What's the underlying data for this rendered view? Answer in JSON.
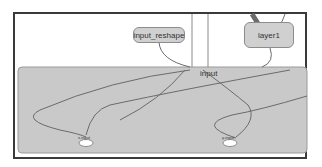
{
  "graph": {
    "nodes": {
      "input_reshape": {
        "label": "input_reshape"
      },
      "layer1": {
        "label": "layer1"
      }
    },
    "group": {
      "label": "input"
    },
    "ops": [
      {
        "label": "x-input"
      },
      {
        "label": "y-input"
      }
    ],
    "colors": {
      "frame_border": "#3a3a3a",
      "group_fill": "#c9c9c9",
      "node_fill": "#d0d0d0",
      "edge": "#6b6b6b",
      "op_fill": "#ffffff"
    }
  }
}
